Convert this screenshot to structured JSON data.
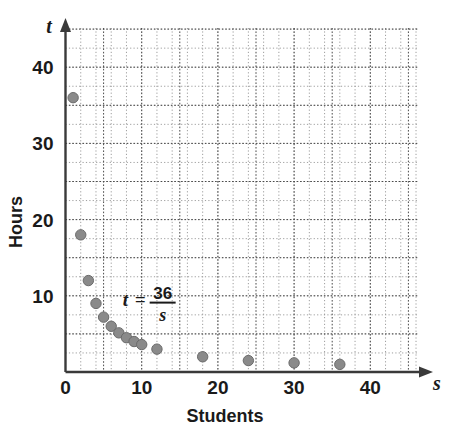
{
  "chart_data": {
    "type": "scatter",
    "title": "",
    "xlabel": "Students",
    "ylabel": "Hours",
    "x_axis_variable": "s",
    "y_axis_variable": "t",
    "xlim": [
      0,
      46
    ],
    "ylim": [
      0,
      46
    ],
    "x_ticks": [
      0,
      10,
      20,
      30,
      40
    ],
    "y_ticks": [
      0,
      10,
      20,
      30,
      40
    ],
    "x_tick_labels": [
      "0",
      "10",
      "20",
      "30",
      "40"
    ],
    "y_tick_labels": [
      "0",
      "10",
      "20",
      "30",
      "40"
    ],
    "x_minor_step": 2,
    "y_minor_step": 2.5,
    "grid": true,
    "legend": "none",
    "annotation": {
      "text": "t = 36/s",
      "lhs": "t",
      "equals": "=",
      "numerator": "36",
      "denominator": "s",
      "x": 7.5,
      "y": 9.5
    },
    "x": [
      1,
      2,
      3,
      4,
      5,
      6,
      7,
      8,
      9,
      10,
      12,
      18,
      24,
      30,
      36
    ],
    "y": [
      36,
      18,
      12,
      9,
      7.2,
      6,
      5.14,
      4.5,
      4,
      3.6,
      3,
      2,
      1.5,
      1.2,
      1
    ],
    "points": [
      {
        "s": 1,
        "t": 36
      },
      {
        "s": 2,
        "t": 18
      },
      {
        "s": 3,
        "t": 12
      },
      {
        "s": 4,
        "t": 9
      },
      {
        "s": 5,
        "t": 7.2
      },
      {
        "s": 6,
        "t": 6
      },
      {
        "s": 7,
        "t": 5.14
      },
      {
        "s": 8,
        "t": 4.5
      },
      {
        "s": 9,
        "t": 4
      },
      {
        "s": 10,
        "t": 3.6
      },
      {
        "s": 12,
        "t": 3
      },
      {
        "s": 18,
        "t": 2
      },
      {
        "s": 24,
        "t": 1.5
      },
      {
        "s": 30,
        "t": 1.2
      },
      {
        "s": 36,
        "t": 1
      }
    ],
    "colors": {
      "point": "#8a8a8a",
      "axis": "#3a3a3a",
      "grid": "#4a4a4a",
      "text": "#1a1a1a",
      "background": "#ffffff"
    }
  }
}
